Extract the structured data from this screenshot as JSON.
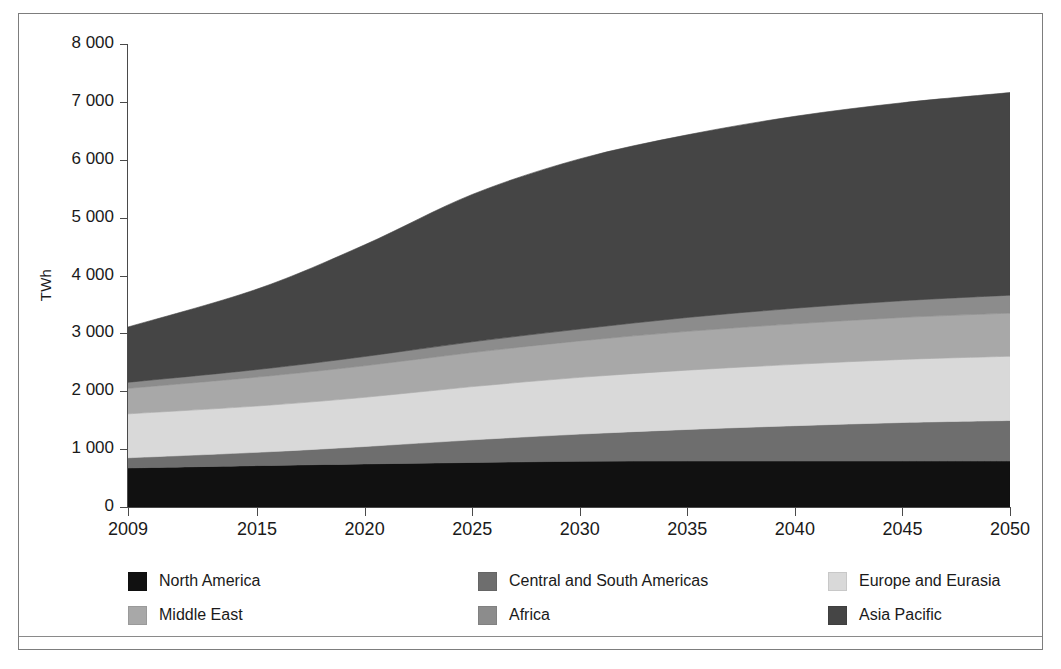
{
  "chart_data": {
    "type": "area",
    "stacked": true,
    "title": "",
    "subtitle": "",
    "xlabel": "",
    "ylabel": "TWh",
    "x": [
      2009,
      2015,
      2020,
      2025,
      2030,
      2035,
      2040,
      2045,
      2050
    ],
    "xtick_labels": [
      "2009",
      "2015",
      "2020",
      "2025",
      "2030",
      "2035",
      "2040",
      "2045",
      "2050"
    ],
    "xlim": [
      2009,
      2050
    ],
    "ylim": [
      0,
      8000
    ],
    "ytick_labels": [
      "0",
      "1 000",
      "2 000",
      "3 000",
      "4 000",
      "5 000",
      "6 000",
      "7 000",
      "8 000"
    ],
    "ytick_values": [
      0,
      1000,
      2000,
      3000,
      4000,
      5000,
      6000,
      7000,
      8000
    ],
    "grid": false,
    "legend_position": "bottom",
    "series": [
      {
        "name": "North America",
        "color": "#111111",
        "values": [
          675,
          715,
          745,
          770,
          790,
          795,
          795,
          795,
          795
        ]
      },
      {
        "name": "Central and South Americas",
        "color": "#6e6e6e",
        "values": [
          175,
          230,
          300,
          390,
          470,
          545,
          610,
          665,
          700
        ]
      },
      {
        "name": "Europe and Eurasia",
        "color": "#d9d9d9",
        "values": [
          760,
          800,
          850,
          920,
          980,
          1025,
          1060,
          1090,
          1110
        ]
      },
      {
        "name": "Middle East",
        "color": "#a8a8a8",
        "values": [
          440,
          500,
          545,
          590,
          630,
          670,
          700,
          725,
          745
        ]
      },
      {
        "name": "Africa",
        "color": "#8c8c8c",
        "values": [
          105,
          130,
          160,
          185,
          205,
          240,
          270,
          290,
          310
        ]
      },
      {
        "name": "Asia Pacific",
        "color": "#454545",
        "values": [
          955,
          1390,
          1930,
          2545,
          2940,
          3155,
          3315,
          3420,
          3500
        ]
      }
    ],
    "stack_totals": [
      3110,
      3765,
      4530,
      5400,
      6015,
      6430,
      6750,
      6985,
      7160
    ]
  },
  "axis": {
    "y_title": "TWh"
  }
}
